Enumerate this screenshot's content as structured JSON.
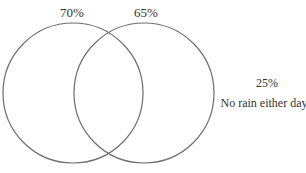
{
  "diagram": {
    "type": "venn",
    "sets": [
      {
        "label": "70%",
        "cx": 73,
        "cy": 93,
        "r": 70
      },
      {
        "label": "65%",
        "cx": 144,
        "cy": 93,
        "r": 70
      }
    ],
    "outside": {
      "value": "25%",
      "caption": "No rain either day"
    },
    "stroke_color": "#6e6e6e",
    "text_color": "#333333"
  }
}
